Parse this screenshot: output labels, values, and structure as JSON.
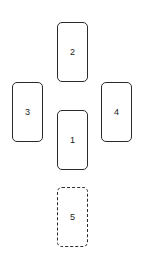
{
  "diagram": {
    "type": "node-layout",
    "background_color": "#ffffff",
    "stroke_color": "#2b2b2b",
    "fill_color": "#ffffff",
    "text_color": "#1a1a1a",
    "nodes": [
      {
        "id": "node-1",
        "label": "1",
        "position": "center",
        "border_style": "solid",
        "shape": "rounded-rectangle"
      },
      {
        "id": "node-2",
        "label": "2",
        "position": "top",
        "border_style": "solid",
        "shape": "rounded-rectangle"
      },
      {
        "id": "node-3",
        "label": "3",
        "position": "left",
        "border_style": "solid",
        "shape": "rounded-rectangle"
      },
      {
        "id": "node-4",
        "label": "4",
        "position": "right",
        "border_style": "solid",
        "shape": "rounded-rectangle"
      },
      {
        "id": "node-5",
        "label": "5",
        "position": "bottom",
        "border_style": "dashed",
        "shape": "rounded-rectangle"
      }
    ]
  }
}
